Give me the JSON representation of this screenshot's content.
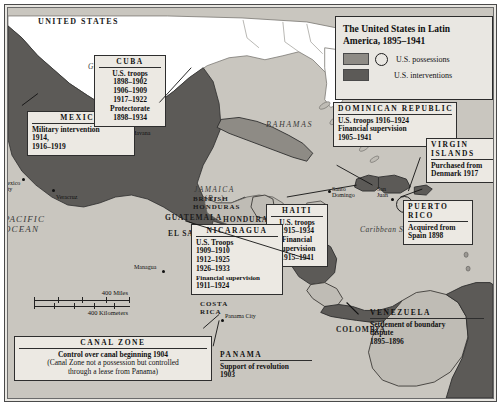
{
  "legend": {
    "title": "The United States in Latin America, 1895–1941",
    "items": [
      {
        "label": "U.S. possessions",
        "color": "#8e8b85",
        "has_circle": true,
        "icon": "possession-circle-icon"
      },
      {
        "label": "U.S. interventions",
        "color": "#5c5a57",
        "has_circle": false,
        "icon": "intervention-swatch-icon"
      }
    ]
  },
  "scale": {
    "miles_label": "400 Miles",
    "km_label": "400 Kilometers"
  },
  "oceans": [
    {
      "name": "atlantic-ocean",
      "text": "ATLANTIC\nOCEAN"
    },
    {
      "name": "pacific-ocean",
      "text": "PACIFIC\nOCEAN"
    },
    {
      "name": "gulf-of-mexico",
      "text": "Gulf of Mexico"
    },
    {
      "name": "caribbean-sea",
      "text": "Caribbean Sea"
    },
    {
      "name": "bahamas",
      "text": "BAHAMAS"
    },
    {
      "name": "jamaica",
      "text": "JAMAICA\n(Br.)"
    }
  ],
  "places": {
    "united_states": "UNITED STATES",
    "mexico_country": "MEXICO",
    "guatemala": "GUATEMALA",
    "el_salvador": "EL SALVADOR",
    "british_honduras": "BRITISH\nHONDURAS",
    "honduras": "HONDURAS",
    "costa_rica": "COSTA\nRICA",
    "colombia": "COLOMBIA",
    "atlantic": "ATLANTIC",
    "ocean": "OCEAN",
    "pacific": "PACIFIC",
    "pacific_ocean": "OCEAN",
    "gulf_of_mexico": "Gulf of Mexico",
    "bahamas": "BAHAMAS",
    "jamaica": "JAMAICA",
    "jamaica_br": "(Br.)",
    "caribbean_sea": "Caribbean Sea"
  },
  "cities": [
    {
      "name": "mexico-city",
      "label": "Mexico\nCity",
      "line1": "Mexico",
      "line2": "City"
    },
    {
      "name": "veracruz",
      "label": "Veracruz"
    },
    {
      "name": "havana",
      "label": "Havana"
    },
    {
      "name": "santo-domingo",
      "label": "Santo\nDomingo",
      "line1": "Santo",
      "line2": "Domingo"
    },
    {
      "name": "san-juan",
      "label": "San\nJuan",
      "line1": "San",
      "line2": "Juan"
    },
    {
      "name": "managua",
      "label": "Managua"
    },
    {
      "name": "panama-city",
      "label": "Panama City"
    }
  ],
  "callouts": {
    "cuba": {
      "head": "CUBA",
      "lines": [
        "U.S. troops",
        "1898–1902",
        "1906–1909",
        "1917–1922",
        "Protectorate",
        "1898–1934"
      ]
    },
    "mexico": {
      "head": "MEXICO",
      "lines": [
        "Military intervention",
        "1914,",
        "1916–1919"
      ]
    },
    "dominican_republic": {
      "head": "DOMINICAN REPUBLIC",
      "lines": [
        "U.S. troops 1916–1924",
        "Financial supervision",
        "1905–1941"
      ]
    },
    "virgin_islands": {
      "head": "VIRGIN\nISLANDS",
      "head_line1": "VIRGIN",
      "head_line2": "ISLANDS",
      "lines": [
        "Purchased from",
        "Denmark 1917"
      ]
    },
    "puerto_rico": {
      "head": "PUERTO\nRICO",
      "head_line1": "PUERTO",
      "head_line2": "RICO",
      "lines": [
        "Acquired from",
        "Spain 1898"
      ]
    },
    "haiti": {
      "head": "HAITI",
      "lines": [
        "U.S. troops",
        "1915–1934",
        "Financial",
        "supervision",
        "1915–1941"
      ]
    },
    "nicaragua": {
      "head": "NICARAGUA",
      "lines": [
        "U.S. Troops",
        "1909–1910",
        "1912–1925",
        "1926–1933",
        "Financial supervision",
        "1911–1924"
      ]
    },
    "canal_zone": {
      "head": "CANAL ZONE",
      "lines": [
        "Control over canal beginning 1904",
        "(Canal Zone not a possession but controlled",
        "through a lease from Panama)"
      ]
    },
    "panama": {
      "head": "PANAMA",
      "lines": [
        "Support of revolution",
        "1903"
      ]
    },
    "venezuela": {
      "head": "VENEZUELA",
      "lines": [
        "Settlement of boundary",
        "dispute",
        "1895–1896"
      ]
    }
  },
  "colors": {
    "water": "#c9c6bf",
    "land_light": "#bfbcb5",
    "intervention": "#5c5a57",
    "possession": "#8e8b85",
    "us_land": "#ffffff",
    "frame": "#2b2b2b",
    "panel_bg": "#e9e7e2"
  }
}
